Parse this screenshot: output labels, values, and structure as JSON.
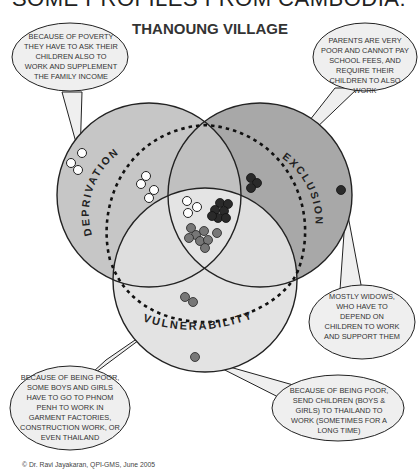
{
  "header": {
    "title": "SOME PROFILES FROM CAMBODIA:",
    "subtitle": "THANOUNG VILLAGE"
  },
  "colors": {
    "deprivation_fill": "#c8c8c8",
    "exclusion_fill": "#a9a9a9",
    "vulnerability_fill": "#e2e2e2",
    "overlap_fill": "#bdbdbd",
    "dot_white": "#ffffff",
    "dot_black": "#2a2a2a",
    "dot_gray": "#777777",
    "outline": "#222222"
  },
  "circles": {
    "deprivation": {
      "label": "DEPRIVATION"
    },
    "exclusion": {
      "label": "EXCLUSION"
    },
    "vulnerability": {
      "label": "VULNERABILITY"
    }
  },
  "callouts": [
    {
      "id": "deprivation-callout",
      "text": "BECAUSE OF POVERTY THEY HAVE TO ASK THEIR CHILDREN ALSO TO WORK AND SUPPLEMENT THE FAMILY INCOME"
    },
    {
      "id": "exclusion-callout",
      "text": "PARENTS ARE VERY POOR AND CANNOT PAY SCHOOL FEES, AND REQUIRE THEIR CHILDREN TO ALSO WORK"
    },
    {
      "id": "widows-callout",
      "text": "MOSTLY WIDOWS, WHO HAVE TO DEPEND ON CHILDREN TO WORK AND SUPPORT THEM"
    },
    {
      "id": "phnom-penh-callout",
      "text": "BECAUSE OF BEING POOR, SOME BOYS AND GIRLS HAVE TO GO TO PHNOM PENH TO WORK IN GARMENT FACTORIES, CONSTRUCTION WORK, OR EVEN THAILAND"
    },
    {
      "id": "thailand-callout",
      "text": "BECAUSE OF BEING POOR, SEND CHILDREN (BOYS & GIRLS) TO THAILAND TO WORK (SOMETIMES FOR A LONG TIME)"
    }
  ],
  "footer": {
    "credit": "© Dr. Ravi Jayakaran, QPI-GMS, June 2005"
  }
}
